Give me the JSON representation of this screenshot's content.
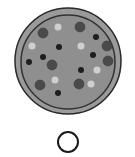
{
  "image": {
    "description": "Grayscale pizza illustration with an empty circle below",
    "colors": {
      "background": "#ffffff",
      "crust": "#9a9a9a",
      "crust_edge": "#2a2a2a",
      "sauce_ring": "#333333",
      "cheese": "#8f8f8f",
      "pepperoni": "#4a4a4a",
      "olive": "#1e1e1e",
      "mushroom": "#cfcfcf",
      "circle_stroke": "#1a1a1a"
    }
  },
  "pizza": {
    "center": [
      68,
      61
    ],
    "outer_radius": 53,
    "inner_radius": 47,
    "pepperoni": [
      [
        43,
        33
      ],
      [
        80,
        27
      ],
      [
        107,
        46
      ],
      [
        108,
        61
      ],
      [
        52,
        65
      ],
      [
        40,
        85
      ],
      [
        79,
        84
      ]
    ],
    "olives": [
      [
        59,
        47
      ],
      [
        96,
        37
      ],
      [
        43,
        57
      ],
      [
        29,
        62
      ],
      [
        93,
        55
      ],
      [
        81,
        70
      ],
      [
        58,
        93
      ]
    ],
    "mushrooms": [
      [
        58,
        27
      ],
      [
        32,
        46
      ],
      [
        81,
        46
      ],
      [
        97,
        70
      ],
      [
        55,
        80
      ],
      [
        91,
        84
      ]
    ]
  },
  "answer_circle": {
    "center": [
      68,
      142
    ],
    "radius": 10
  }
}
